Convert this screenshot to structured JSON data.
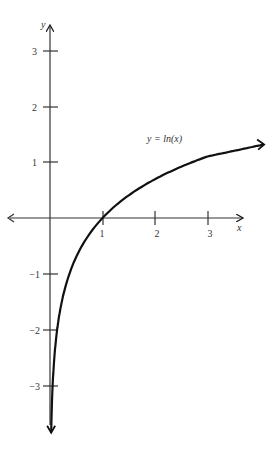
{
  "chart_data": {
    "type": "line",
    "title": "",
    "xlabel": "x",
    "ylabel": "y",
    "annotation": "y = ln(x)",
    "function": "ln(x)",
    "series": [
      {
        "name": "y = ln(x)",
        "x": [
          0.02,
          0.05,
          0.1,
          0.135,
          0.2,
          0.3,
          0.5,
          0.75,
          1,
          1.5,
          2,
          2.5,
          3,
          3.5,
          4.06
        ],
        "y": [
          -3.91,
          -3.0,
          -2.3,
          -2.0,
          -1.61,
          -1.2,
          -0.69,
          -0.29,
          0,
          0.41,
          0.69,
          0.92,
          1.1,
          1.25,
          1.4
        ]
      }
    ],
    "x_ticks": [
      1,
      2,
      3
    ],
    "y_ticks": [
      3,
      2,
      1,
      -1,
      -2,
      -3
    ],
    "xlim": [
      -0.95,
      4.1
    ],
    "ylim": [
      -3.65,
      3.2
    ],
    "grid": false,
    "legend": "none",
    "line_color": "#111111",
    "axis_color": "#333333"
  },
  "labels": {
    "x_axis": "x",
    "y_axis": "y",
    "curve": "y = ln(x)",
    "x_ticks": [
      "1",
      "2",
      "3"
    ],
    "y_ticks": [
      "3",
      "2",
      "1",
      "−1",
      "−2",
      "−3"
    ]
  }
}
